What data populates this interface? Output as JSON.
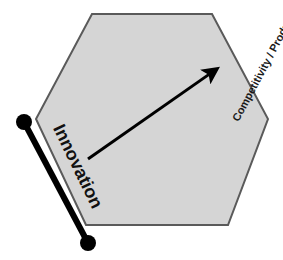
{
  "diagram": {
    "background_color": "#ffffff",
    "shape": {
      "name": "hexagon",
      "fill_color": "#d5d5d5",
      "stroke_color": "#5a5a5a",
      "stroke_width": 2,
      "points": "92,14 212,14 268,119 228,225 86,225 36,119"
    },
    "innovation_axis": {
      "label": "Innovation",
      "label_rotation_deg": 64,
      "line_color": "#000000",
      "line_width": 6,
      "dot_radius": 8,
      "dot_color": "#000000",
      "start_point": {
        "x": 24,
        "y": 122
      },
      "end_point": {
        "x": 88,
        "y": 243
      }
    },
    "competitivity_axis": {
      "label": "Competitivity / Productivity",
      "label_rotation_deg": -62,
      "label_color": "#1a1a1a"
    },
    "arrow": {
      "name": "growth-arrow",
      "color": "#000000",
      "line_width": 3,
      "tail_point": {
        "x": 88,
        "y": 159
      },
      "tip_point": {
        "x": 221,
        "y": 66
      },
      "head_size": 13
    }
  }
}
